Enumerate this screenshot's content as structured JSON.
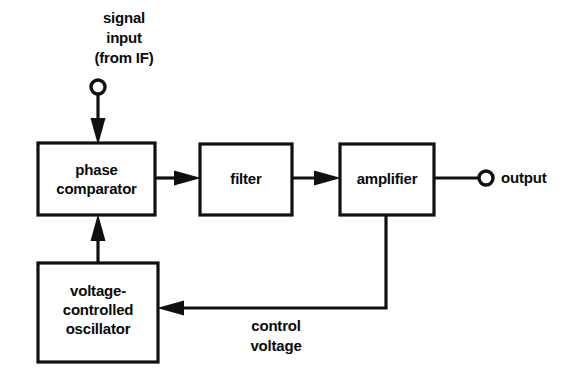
{
  "diagram": {
    "background_color": "#ffffff",
    "line_color": "#101010",
    "blocks": [
      {
        "id": "phase-comparator",
        "lines": [
          "phase",
          "comparator"
        ],
        "x": 38,
        "y": 143,
        "w": 117,
        "h": 72
      },
      {
        "id": "filter",
        "lines": [
          "filter"
        ],
        "x": 200,
        "y": 144,
        "w": 92,
        "h": 71
      },
      {
        "id": "amplifier",
        "lines": [
          "amplifier"
        ],
        "x": 340,
        "y": 144,
        "w": 94,
        "h": 71
      },
      {
        "id": "voltage-controlled-oscillator",
        "lines": [
          "voltage-",
          "controlled",
          "oscillator"
        ],
        "x": 38,
        "y": 263,
        "w": 120,
        "h": 99
      }
    ],
    "labels": [
      {
        "id": "signal-input-label",
        "lines": [
          "signal",
          "input",
          "(from IF)"
        ],
        "cx": 124,
        "cy": 12
      },
      {
        "id": "output-label",
        "lines": [
          "output"
        ],
        "x": 501,
        "cy": 178
      },
      {
        "id": "control-voltage-label",
        "lines": [
          "control",
          "voltage"
        ],
        "cx": 276,
        "cy": 325
      }
    ],
    "terminals": [
      {
        "id": "signal-input-terminal",
        "cx": 98,
        "cy": 87,
        "r": 7
      },
      {
        "id": "output-terminal",
        "cx": 486,
        "cy": 178,
        "r": 7
      }
    ],
    "connections": [
      {
        "id": "input-to-comparator",
        "from": "signal-input-terminal",
        "to": "phase-comparator",
        "direction": "down"
      },
      {
        "id": "comparator-to-filter",
        "from": "phase-comparator",
        "to": "filter",
        "direction": "right"
      },
      {
        "id": "filter-to-amplifier",
        "from": "filter",
        "to": "amplifier",
        "direction": "right"
      },
      {
        "id": "amplifier-to-output",
        "from": "amplifier",
        "to": "output-terminal",
        "direction": "right"
      },
      {
        "id": "amplifier-to-vco-feedback",
        "from": "amplifier",
        "to": "voltage-controlled-oscillator",
        "direction": "left",
        "label": "control voltage"
      },
      {
        "id": "vco-to-comparator",
        "from": "voltage-controlled-oscillator",
        "to": "phase-comparator",
        "direction": "up"
      }
    ]
  }
}
